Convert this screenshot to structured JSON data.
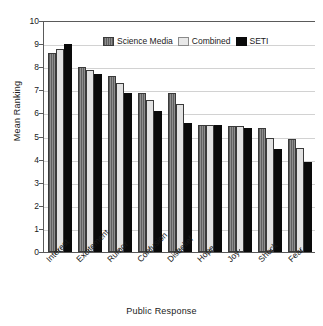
{
  "chart_data": {
    "type": "bar",
    "title": "",
    "xlabel": "Public Response",
    "ylabel": "Mean Ranking",
    "ylim": [
      0,
      10
    ],
    "ytick_labels": [
      "10",
      "9",
      "8",
      "7",
      "6",
      "5",
      "4",
      "3",
      "2",
      "1",
      "0"
    ],
    "grid": true,
    "legend_position": "top-center",
    "categories": [
      "Interest",
      "Excitement",
      "Rumor",
      "Confusion",
      "Disbelief",
      "Hope",
      "Joy",
      "Shock",
      "Fear"
    ],
    "series": [
      {
        "name": "Science Media",
        "color": "#777777",
        "values": [
          8.6,
          8.0,
          7.6,
          6.9,
          6.9,
          5.5,
          5.45,
          5.35,
          4.9
        ]
      },
      {
        "name": "Combined",
        "color": "#e2e2e2",
        "values": [
          8.8,
          7.9,
          7.3,
          6.6,
          6.4,
          5.5,
          5.45,
          4.95,
          4.5
        ]
      },
      {
        "name": "SETI",
        "color": "#0a0a0a",
        "values": [
          9.0,
          7.7,
          6.9,
          6.1,
          5.6,
          5.5,
          5.35,
          4.45,
          3.9
        ]
      }
    ]
  }
}
